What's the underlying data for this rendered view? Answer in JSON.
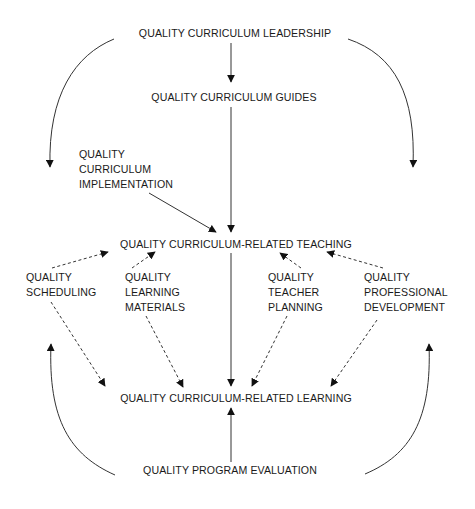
{
  "diagram": {
    "type": "flow-diagram",
    "nodes": {
      "leadership": {
        "label": "QUALITY CURRICULUM LEADERSHIP"
      },
      "guides": {
        "label": "QUALITY CURRICULUM GUIDES"
      },
      "implementation": {
        "lines": [
          "QUALITY",
          "CURRICULUM",
          "IMPLEMENTATION"
        ]
      },
      "teaching": {
        "label": "QUALITY CURRICULUM-RELATED TEACHING"
      },
      "scheduling": {
        "lines": [
          "QUALITY",
          "SCHEDULING"
        ]
      },
      "materials": {
        "lines": [
          "QUALITY",
          "LEARNING",
          "MATERIALS"
        ]
      },
      "planning": {
        "lines": [
          "QUALITY",
          "TEACHER",
          "PLANNING"
        ]
      },
      "development": {
        "lines": [
          "QUALITY",
          "PROFESSIONAL",
          "DEVELOPMENT"
        ]
      },
      "learning": {
        "label": "QUALITY CURRICULUM-RELATED LEARNING"
      },
      "evaluation": {
        "label": "QUALITY PROGRAM EVALUATION"
      }
    },
    "edges": [
      {
        "from": "leadership",
        "to": "guides",
        "style": "solid"
      },
      {
        "from": "leadership",
        "to": "left-side",
        "style": "solid-curved"
      },
      {
        "from": "leadership",
        "to": "right-side",
        "style": "solid-curved"
      },
      {
        "from": "guides",
        "to": "teaching",
        "style": "solid"
      },
      {
        "from": "implementation",
        "to": "teaching",
        "style": "solid"
      },
      {
        "from": "scheduling",
        "to": "teaching",
        "style": "dashed"
      },
      {
        "from": "materials",
        "to": "teaching",
        "style": "dashed"
      },
      {
        "from": "planning",
        "to": "teaching",
        "style": "dashed"
      },
      {
        "from": "development",
        "to": "teaching",
        "style": "dashed"
      },
      {
        "from": "scheduling",
        "to": "learning",
        "style": "dashed"
      },
      {
        "from": "materials",
        "to": "learning",
        "style": "dashed"
      },
      {
        "from": "teaching",
        "to": "learning",
        "style": "solid"
      },
      {
        "from": "planning",
        "to": "learning",
        "style": "dashed"
      },
      {
        "from": "development",
        "to": "learning",
        "style": "dashed"
      },
      {
        "from": "evaluation",
        "to": "learning",
        "style": "solid"
      },
      {
        "from": "evaluation",
        "to": "left-side",
        "style": "solid-curved"
      },
      {
        "from": "evaluation",
        "to": "right-side",
        "style": "solid-curved"
      }
    ],
    "colors": {
      "background": "#ffffff",
      "text": "#1a1a1a",
      "line": "#333333",
      "arrowhead": "#111111"
    }
  }
}
